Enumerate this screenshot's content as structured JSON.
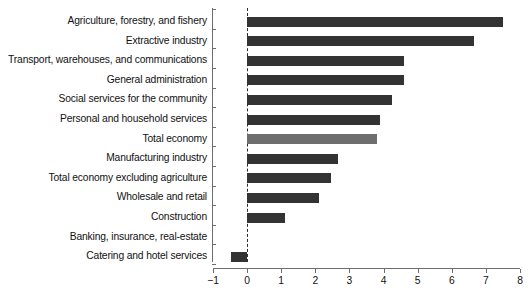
{
  "chart_data": {
    "type": "bar",
    "orientation": "horizontal",
    "title": "",
    "subtitle": "",
    "xlabel": "",
    "ylabel": "",
    "xlim": [
      -1,
      8
    ],
    "xticks": [
      -1,
      0,
      1,
      2,
      3,
      4,
      5,
      6,
      7,
      8
    ],
    "xtick_labels": [
      "-1",
      "0",
      "1",
      "2",
      "3",
      "4",
      "5",
      "6",
      "7",
      "8"
    ],
    "grid": false,
    "legend": "none",
    "zero_reference_line": true,
    "categories": [
      "Agriculture, forestry, and fishery",
      "Extractive industry",
      "Transport, warehouses, and communications",
      "General administration",
      "Social services for the community",
      "Personal and household services",
      "Total economy",
      "Manufacturing industry",
      "Total economy excluding agriculture",
      "Wholesale and retail",
      "Construction",
      "Banking, insurance, real-estate",
      "Catering and hotel services"
    ],
    "values": [
      7.5,
      6.65,
      4.6,
      4.6,
      4.25,
      3.9,
      3.8,
      2.65,
      2.45,
      2.1,
      1.1,
      0.0,
      -0.47
    ],
    "bar_colors": [
      "#333333",
      "#333333",
      "#333333",
      "#333333",
      "#333333",
      "#333333",
      "#6e6e6e",
      "#333333",
      "#333333",
      "#333333",
      "#333333",
      "#333333",
      "#333333"
    ],
    "highlight_category": "Total economy",
    "highlight_color": "#6e6e6e",
    "default_color": "#333333",
    "axis_color": "#6d6d6d"
  }
}
